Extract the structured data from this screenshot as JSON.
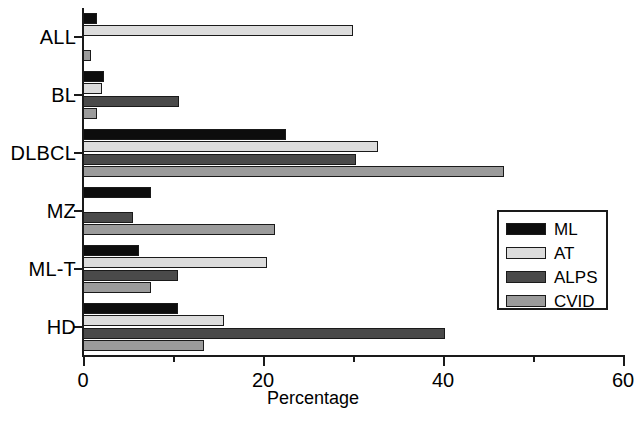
{
  "chart_data": {
    "type": "bar",
    "orientation": "horizontal",
    "title": "",
    "xlabel": "Percentage",
    "ylabel": "",
    "xlim": [
      0,
      60
    ],
    "xticks": [
      0,
      20,
      40,
      60
    ],
    "xticks_minor": [
      10,
      30,
      50
    ],
    "xtick_labels": [
      "0",
      "20",
      "40",
      "60"
    ],
    "grid": false,
    "legend_position": "center-right",
    "categories": [
      "ALL",
      "BL",
      "DLBCL",
      "MZ",
      "ML-T",
      "HD"
    ],
    "series": [
      {
        "name": "ML",
        "color": "#0d0d0d",
        "values": [
          1.6,
          2.3,
          22.6,
          7.6,
          6.2,
          10.5
        ]
      },
      {
        "name": "AT",
        "color": "#dcdcdc",
        "values": [
          30.0,
          2.1,
          32.8,
          0,
          20.4,
          15.7
        ]
      },
      {
        "name": "ALPS",
        "color": "#4a4a4a",
        "values": [
          0,
          10.7,
          30.3,
          5.5,
          10.6,
          40.2
        ]
      },
      {
        "name": "CVID",
        "color": "#9b9b9b",
        "values": [
          0.9,
          1.5,
          46.8,
          21.3,
          7.5,
          13.4
        ]
      }
    ]
  },
  "legend": {
    "items": [
      {
        "label": "ML",
        "swatch": "legend-swatch-ml"
      },
      {
        "label": "AT",
        "swatch": "legend-swatch-at"
      },
      {
        "label": "ALPS",
        "swatch": "legend-swatch-alps"
      },
      {
        "label": "CVID",
        "swatch": "legend-swatch-cvid"
      }
    ]
  }
}
